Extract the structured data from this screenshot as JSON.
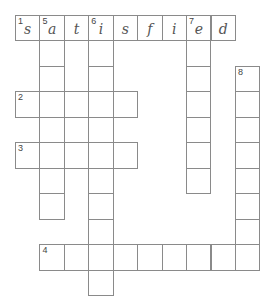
{
  "puzzle": {
    "type": "crossword",
    "grid_origin": {
      "x": 15,
      "y": 14.5
    },
    "cell_size": {
      "w": 24.44,
      "h": 25.5
    },
    "cells": [
      {
        "r": 0,
        "c": 0,
        "num": "1",
        "letter": "s"
      },
      {
        "r": 0,
        "c": 1,
        "num": "5",
        "letter": "a"
      },
      {
        "r": 0,
        "c": 2,
        "num": "",
        "letter": "t"
      },
      {
        "r": 0,
        "c": 3,
        "num": "6",
        "letter": "i"
      },
      {
        "r": 0,
        "c": 4,
        "num": "",
        "letter": "s"
      },
      {
        "r": 0,
        "c": 5,
        "num": "",
        "letter": "f"
      },
      {
        "r": 0,
        "c": 6,
        "num": "",
        "letter": "i"
      },
      {
        "r": 0,
        "c": 7,
        "num": "7",
        "letter": "e"
      },
      {
        "r": 0,
        "c": 8,
        "num": "",
        "letter": "d"
      },
      {
        "r": 1,
        "c": 1
      },
      {
        "r": 2,
        "c": 1
      },
      {
        "r": 4,
        "c": 1
      },
      {
        "r": 6,
        "c": 1
      },
      {
        "r": 7,
        "c": 1
      },
      {
        "r": 1,
        "c": 3
      },
      {
        "r": 2,
        "c": 3
      },
      {
        "r": 4,
        "c": 3
      },
      {
        "r": 6,
        "c": 3
      },
      {
        "r": 7,
        "c": 3
      },
      {
        "r": 8,
        "c": 3
      },
      {
        "r": 10,
        "c": 3
      },
      {
        "r": 1,
        "c": 7
      },
      {
        "r": 2,
        "c": 7
      },
      {
        "r": 3,
        "c": 7
      },
      {
        "r": 4,
        "c": 7
      },
      {
        "r": 5,
        "c": 7
      },
      {
        "r": 6,
        "c": 7
      },
      {
        "r": 2,
        "c": 9,
        "num": "8"
      },
      {
        "r": 3,
        "c": 9
      },
      {
        "r": 4,
        "c": 9
      },
      {
        "r": 5,
        "c": 9
      },
      {
        "r": 6,
        "c": 9
      },
      {
        "r": 7,
        "c": 9
      },
      {
        "r": 8,
        "c": 9
      },
      {
        "r": 3,
        "c": 0,
        "num": "2"
      },
      {
        "r": 3,
        "c": 1
      },
      {
        "r": 3,
        "c": 2
      },
      {
        "r": 3,
        "c": 3
      },
      {
        "r": 3,
        "c": 4
      },
      {
        "r": 5,
        "c": 0,
        "num": "3"
      },
      {
        "r": 5,
        "c": 1
      },
      {
        "r": 5,
        "c": 2
      },
      {
        "r": 5,
        "c": 3
      },
      {
        "r": 5,
        "c": 4
      },
      {
        "r": 9,
        "c": 1,
        "num": "4"
      },
      {
        "r": 9,
        "c": 2
      },
      {
        "r": 9,
        "c": 3
      },
      {
        "r": 9,
        "c": 4
      },
      {
        "r": 9,
        "c": 5
      },
      {
        "r": 9,
        "c": 6
      },
      {
        "r": 9,
        "c": 7
      },
      {
        "r": 9,
        "c": 8
      },
      {
        "r": 9,
        "c": 9
      }
    ],
    "entries": {
      "across": [
        {
          "number": "1",
          "answer_shown": "satisfied",
          "length": 9
        },
        {
          "number": "2",
          "answer_shown": "",
          "length": 5
        },
        {
          "number": "3",
          "answer_shown": "",
          "length": 5
        },
        {
          "number": "4",
          "answer_shown": "",
          "length": 9
        }
      ],
      "down": [
        {
          "number": "5",
          "answer_shown": "a",
          "length": 8
        },
        {
          "number": "6",
          "answer_shown": "i",
          "length": 11
        },
        {
          "number": "7",
          "answer_shown": "e",
          "length": 7
        },
        {
          "number": "8",
          "answer_shown": "",
          "length": 8
        }
      ]
    },
    "colors": {
      "grid_line": "#8a8a8a",
      "letter": "#555555",
      "number": "#444444",
      "background": "#ffffff"
    }
  }
}
